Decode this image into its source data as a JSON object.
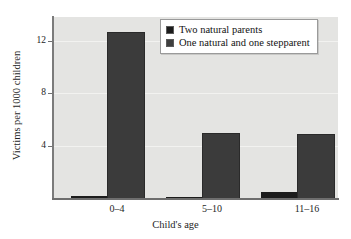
{
  "chart_data": {
    "type": "bar",
    "title": "",
    "subtitle": "",
    "xlabel": "Child's age",
    "ylabel": "Victims per 1000 children",
    "categories": [
      "0–4",
      "5–10",
      "11–16"
    ],
    "series": [
      {
        "name": "Two natural parents",
        "values": [
          0.2,
          0.15,
          0.5
        ],
        "color": "#1c1c1c"
      },
      {
        "name": "One natural and one stepparent",
        "values": [
          12.7,
          5.0,
          4.9
        ],
        "color": "#3b3b3b"
      }
    ],
    "ylim": [
      0,
      13.8
    ],
    "yticks": [
      4,
      8,
      12
    ],
    "ytick_labels": [
      "4",
      "8",
      "12"
    ],
    "grid": true,
    "legend_position": "top-right",
    "plot_background": "#e4e4e2",
    "figure_background": "#ffffff"
  },
  "axes": {
    "y_tick_0": "12",
    "y_tick_1": "8",
    "y_tick_2": "4",
    "y_title": "Victims per 1000 children",
    "x_title": "Child's age",
    "x_cat_0": "0–4",
    "x_cat_1": "5–10",
    "x_cat_2": "11–16"
  },
  "legend": {
    "entries": [
      {
        "label": "Two natural parents"
      },
      {
        "label": "One natural and one stepparent"
      }
    ]
  }
}
